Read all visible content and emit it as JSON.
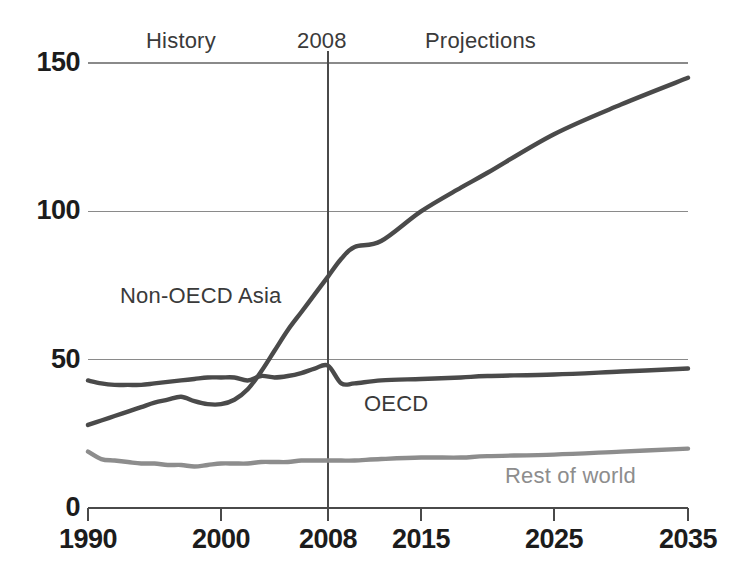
{
  "chart_data": {
    "type": "line",
    "title": "",
    "subtitle": "",
    "xlabel": "",
    "ylabel": "",
    "xlim": [
      1990,
      2035
    ],
    "ylim": [
      0,
      150
    ],
    "grid": true,
    "grid_axis": "y",
    "legend_position": "inline-annotations",
    "x_ticks": [
      "1990",
      "2000",
      "2008",
      "2015",
      "2025",
      "2035"
    ],
    "x_tick_values": [
      1990,
      2000,
      2008,
      2015,
      2025,
      2035
    ],
    "y_ticks": [
      "0",
      "50",
      "100",
      "150"
    ],
    "y_tick_values": [
      0,
      50,
      100,
      150
    ],
    "divider_year": 2008,
    "annotations": [
      {
        "name": "history",
        "text": "History",
        "x": 1996
      },
      {
        "name": "divider-year",
        "text": "2008",
        "x": 2008
      },
      {
        "name": "projections",
        "text": "Projections",
        "x": 2018
      }
    ],
    "x": [
      1990,
      1991,
      1992,
      1993,
      1994,
      1995,
      1996,
      1997,
      1998,
      1999,
      2000,
      2001,
      2002,
      2003,
      2004,
      2005,
      2006,
      2007,
      2008,
      2009,
      2010,
      2012,
      2015,
      2018,
      2020,
      2025,
      2030,
      2035
    ],
    "series": [
      {
        "name": "OECD",
        "label": "OECD",
        "color": "#4a4a4a",
        "values": [
          43,
          42,
          41.5,
          41.5,
          41.5,
          42,
          42.5,
          43,
          43.5,
          44,
          44,
          44,
          43,
          44.5,
          44,
          44.5,
          45.5,
          47,
          48,
          42,
          42,
          43,
          43.5,
          44,
          44.5,
          45,
          46,
          47
        ]
      },
      {
        "name": "Non-OECD Asia",
        "label": "Non-OECD Asia",
        "color": "#4a4a4a",
        "values": [
          28,
          29.5,
          31,
          32.5,
          34,
          35.5,
          36.5,
          37.5,
          36,
          35,
          35,
          36.5,
          40,
          46,
          53,
          60,
          66,
          72,
          78,
          84,
          88,
          90,
          100,
          108,
          113,
          126,
          136,
          145
        ]
      },
      {
        "name": "Rest of world",
        "label": "Rest of world",
        "color": "#8d8d8d",
        "values": [
          19,
          16.5,
          16,
          15.5,
          15,
          15,
          14.5,
          14.5,
          14,
          14.5,
          15,
          15,
          15,
          15.5,
          15.5,
          15.5,
          16,
          16,
          16,
          16,
          16,
          16.5,
          17,
          17,
          17.5,
          18,
          19,
          20
        ]
      }
    ],
    "series_labels": [
      {
        "name": "non-oecd-asia",
        "text": "Non-OECD Asia",
        "color": "#3a3a3a"
      },
      {
        "name": "oecd",
        "text": "OECD",
        "color": "#3a3a3a"
      },
      {
        "name": "rest-of-world",
        "text": "Rest of world",
        "color": "#8d8d8d"
      }
    ],
    "colors": {
      "axis": "#4a4a4a",
      "grid": "#8a8a8a",
      "dark_series": "#4a4a4a",
      "light_series": "#8d8d8d",
      "text": "#1c1c1c",
      "background": "#ffffff"
    }
  }
}
